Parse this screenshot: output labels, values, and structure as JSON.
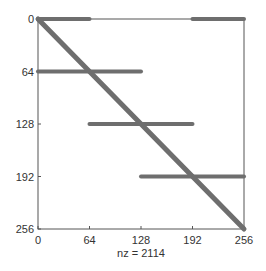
{
  "chart_data": {
    "type": "scatter",
    "subtype": "spy-sparsity-pattern",
    "title": "",
    "xlabel": "nz = 2114",
    "ylabel": "",
    "xlim": [
      0,
      256
    ],
    "ylim": [
      256,
      0
    ],
    "xticks": [
      "0",
      "64",
      "128",
      "192",
      "256"
    ],
    "yticks": [
      "0",
      "64",
      "128",
      "192",
      "256"
    ],
    "grid": false,
    "nonzero_count": 2114,
    "segments": [
      {
        "name": "diagonal",
        "x": [
          0,
          256
        ],
        "y": [
          0,
          256
        ]
      },
      {
        "name": "row-0-left",
        "x": [
          0,
          64
        ],
        "y": [
          0,
          0
        ]
      },
      {
        "name": "row-0-right",
        "x": [
          192,
          256
        ],
        "y": [
          0,
          0
        ]
      },
      {
        "name": "row-64",
        "x": [
          0,
          128
        ],
        "y": [
          64,
          64
        ]
      },
      {
        "name": "row-128",
        "x": [
          64,
          192
        ],
        "y": [
          128,
          128
        ]
      },
      {
        "name": "row-192",
        "x": [
          128,
          256
        ],
        "y": [
          192,
          192
        ]
      }
    ],
    "marker_color": "#6e6e6e"
  },
  "labels": {
    "xlabel": "nz = 2114",
    "xticks": [
      "0",
      "64",
      "128",
      "192",
      "256"
    ],
    "yticks": [
      "0",
      "64",
      "128",
      "192",
      "256"
    ]
  }
}
